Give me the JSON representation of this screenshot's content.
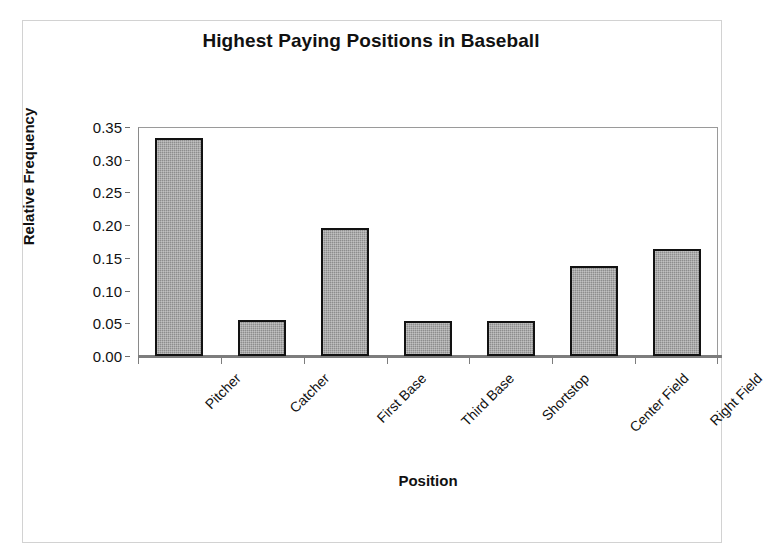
{
  "figure": {
    "title": "Highest Paying Positions in Baseball",
    "x_axis_title": "Position",
    "y_axis_title": "Relative Frequency"
  },
  "chart_data": {
    "type": "bar",
    "title": "Highest Paying Positions in Baseball",
    "xlabel": "Position",
    "ylabel": "Relative Frequency",
    "categories": [
      "Pitcher",
      "Catcher",
      "First Base",
      "Third Base",
      "Shortstop",
      "Center Field",
      "Right Field"
    ],
    "values": [
      0.333,
      0.055,
      0.195,
      0.054,
      0.053,
      0.137,
      0.164
    ],
    "ylim": [
      0.0,
      0.35
    ],
    "ytick_labels": [
      "0.00",
      "0.05",
      "0.10",
      "0.15",
      "0.20",
      "0.25",
      "0.30",
      "0.35"
    ],
    "ytick_values": [
      0.0,
      0.05,
      0.1,
      0.15,
      0.2,
      0.25,
      0.3,
      0.35
    ],
    "grid": false,
    "legend": false,
    "bar_fill_color": "#8d8d8d",
    "bar_edge_color": "#121212",
    "plot_border_color": "#8a8a8a",
    "background_color": "#ffffff"
  }
}
